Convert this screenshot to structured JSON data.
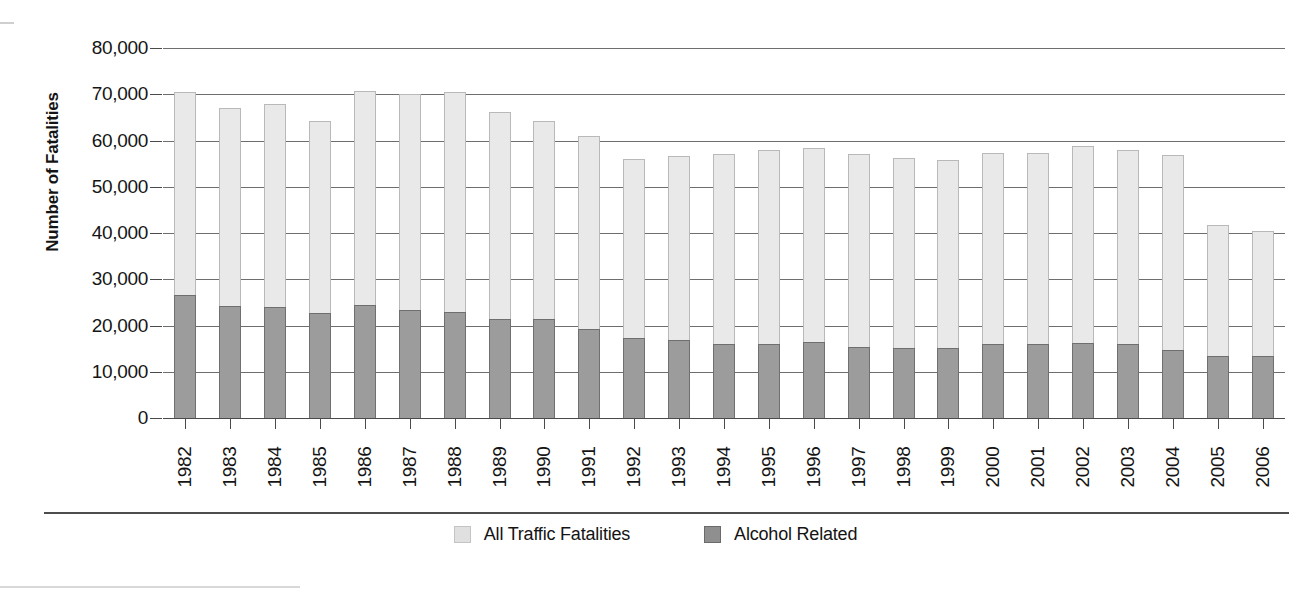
{
  "chart_data": {
    "type": "bar",
    "title": "",
    "xlabel": "",
    "ylabel": "Number of Fatalities",
    "ylim": [
      0,
      80000
    ],
    "yticks": [
      0,
      10000,
      20000,
      30000,
      40000,
      50000,
      60000,
      70000,
      80000
    ],
    "ytick_labels": [
      "0",
      "10,000",
      "20,000",
      "30,000",
      "40,000",
      "50,000",
      "60,000",
      "70,000",
      "80,000"
    ],
    "grid": true,
    "stacked": true,
    "legend_position": "bottom",
    "categories": [
      "1982",
      "1983",
      "1984",
      "1985",
      "1986",
      "1987",
      "1988",
      "1989",
      "1990",
      "1991",
      "1992",
      "1993",
      "1994",
      "1995",
      "1996",
      "1997",
      "1998",
      "1999",
      "2000",
      "2001",
      "2002",
      "2003",
      "2004",
      "2005",
      "2006"
    ],
    "series": [
      {
        "name": "All Traffic Fatalities",
        "color": "#e9e9e9",
        "values": [
          70500,
          67000,
          68000,
          64200,
          70800,
          70000,
          70500,
          66100,
          64200,
          61000,
          55900,
          56700,
          57000,
          58000,
          58300,
          57100,
          56300,
          55700,
          57200,
          57300,
          58900,
          57900,
          56900,
          41800,
          40500
        ]
      },
      {
        "name": "Alcohol Related",
        "color": "#9c9c9c",
        "values": [
          26500,
          24300,
          24000,
          22700,
          24400,
          23400,
          23000,
          21500,
          21400,
          19300,
          17300,
          16800,
          16000,
          16000,
          16400,
          15400,
          15200,
          15200,
          16100,
          16000,
          16200,
          15900,
          14700,
          13400,
          13400
        ]
      }
    ]
  },
  "legend": {
    "items": [
      {
        "label": "All Traffic Fatalities",
        "swatch": "total"
      },
      {
        "label": "Alcohol Related",
        "swatch": "alcohol"
      }
    ]
  }
}
